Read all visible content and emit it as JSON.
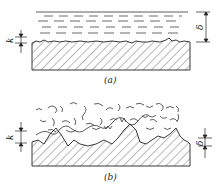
{
  "figure": {
    "panels": [
      {
        "id": "a",
        "caption": "(a)",
        "description": "hydraulically smooth wall: laminar sublayer thickness δ greater than roughness height k",
        "labels": {
          "roughness": "k",
          "sublayer": "δ"
        }
      },
      {
        "id": "b",
        "caption": "(b)",
        "description": "hydraulically rough wall: roughness height k exceeds laminar sublayer thickness δ",
        "labels": {
          "roughness": "k",
          "sublayer": "δ"
        }
      }
    ]
  },
  "colors": {
    "ink": "#222222",
    "background": "#ffffff"
  }
}
